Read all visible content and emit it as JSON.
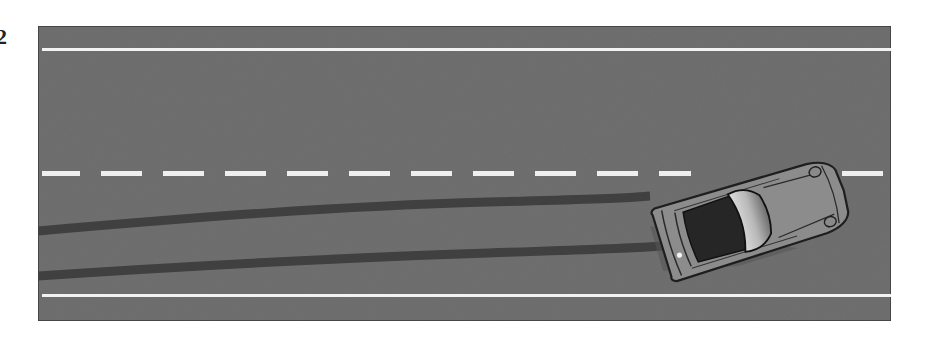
{
  "figure": {
    "label": "2"
  },
  "scene": {
    "road": {
      "surface_color": "#6f6f6f",
      "edge_line_color": "#f2f2f2",
      "center_line_color": "#f0f0f0",
      "center_line_style": "dashed",
      "dash_length": 41,
      "dash_gap": 21
    },
    "skid_marks": {
      "count": 2,
      "color": "#3f3f3f"
    },
    "car": {
      "type": "sports-car-convertible-top-view",
      "body_color": "#8a8a8a",
      "roof_color": "#252525",
      "windshield_color": "#bdbdbd",
      "orientation_deg": -17
    }
  }
}
